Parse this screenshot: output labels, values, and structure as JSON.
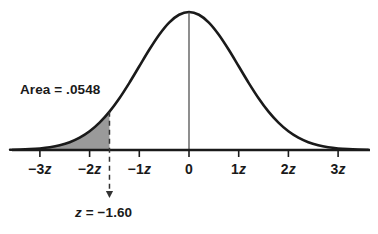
{
  "figure": {
    "background_color": "#ffffff",
    "curve_color": "#1a1a1a",
    "shade_color": "#9a9a9a",
    "axis_color": "#1a1a1a",
    "text_color": "#1a1a1a"
  },
  "labels": {
    "area": "Area = .0548",
    "annotation": "z = −1.60",
    "annotation_prefix": "z",
    "annotation_suffix": " = −1.60"
  },
  "axis": {
    "tick_labels": [
      "−3z",
      "−2z",
      "−1z",
      "0",
      "1z",
      "2z",
      "3z"
    ],
    "tick_values": [
      -3,
      -2,
      -1,
      0,
      1,
      2,
      3
    ],
    "tick_text": [
      {
        "num": "−3",
        "z": "z"
      },
      {
        "num": "−2",
        "z": "z"
      },
      {
        "num": "−1",
        "z": "z"
      },
      {
        "num": "0",
        "z": ""
      },
      {
        "num": "1",
        "z": "z"
      },
      {
        "num": "2",
        "z": "z"
      },
      {
        "num": "3",
        "z": "z"
      }
    ]
  },
  "chart_data": {
    "type": "area",
    "xlabel": "",
    "ylabel": "",
    "xlim": [
      -3.6,
      3.7
    ],
    "ylim": [
      0,
      0.42
    ],
    "grid": false,
    "legend": null,
    "distribution": "standard normal (z)",
    "critical_value": -1.6,
    "shaded_region": {
      "from": "-infinity",
      "to": -1.6,
      "area": 0.0548,
      "area_label": "Area = .0548",
      "side": "left tail",
      "fill": "#9a9a9a"
    },
    "annotations": [
      {
        "text": "Area = .0548",
        "x": -2.95,
        "y": 0.255
      },
      {
        "text": "z = −1.60",
        "x": -1.6,
        "y": -0.14,
        "arrow_to_x": -1.6,
        "arrow_to_y": -0.085
      }
    ],
    "dashed_line": {
      "x": -1.6,
      "y_top": 0.1109,
      "y_bottom": -0.09
    },
    "center_line": {
      "x": 0,
      "y_top": 0.3989,
      "y_bottom": 0
    },
    "xticks": [
      -3,
      -2,
      -1,
      0,
      1,
      2,
      3
    ],
    "xticklabels": [
      "−3z",
      "−2z",
      "−1z",
      "0",
      "1z",
      "2z",
      "3z"
    ],
    "yticks": [],
    "series": [
      {
        "name": "standard normal density",
        "x": [
          -3.6,
          -3.4,
          -3.2,
          -3.0,
          -2.8,
          -2.6,
          -2.4,
          -2.2,
          -2.0,
          -1.8,
          -1.6,
          -1.4,
          -1.2,
          -1.0,
          -0.8,
          -0.6,
          -0.4,
          -0.2,
          0.0,
          0.2,
          0.4,
          0.6,
          0.8,
          1.0,
          1.2,
          1.4,
          1.6,
          1.8,
          2.0,
          2.2,
          2.4,
          2.6,
          2.8,
          3.0,
          3.2,
          3.4,
          3.6
        ],
        "y": [
          0.0006,
          0.0012,
          0.0024,
          0.0044,
          0.0079,
          0.0136,
          0.0224,
          0.0355,
          0.054,
          0.079,
          0.1109,
          0.1497,
          0.1942,
          0.242,
          0.2897,
          0.3332,
          0.3683,
          0.391,
          0.3989,
          0.391,
          0.3683,
          0.3332,
          0.2897,
          0.242,
          0.1942,
          0.1497,
          0.1109,
          0.079,
          0.054,
          0.0355,
          0.0224,
          0.0136,
          0.0079,
          0.0044,
          0.0024,
          0.0012,
          0.0006
        ]
      }
    ]
  }
}
